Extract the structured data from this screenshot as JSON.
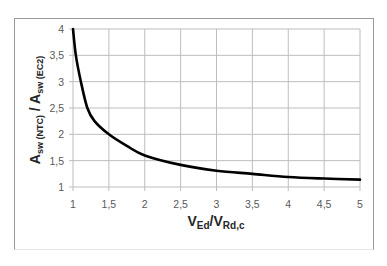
{
  "chart_data": {
    "type": "line",
    "title": "",
    "xlabel": "VEd/VRd,c",
    "ylabel": "Asw (NTC) / Asw (EC2)",
    "xlabel_parts": {
      "main1": "V",
      "sub1": "Ed",
      "sep": "/",
      "main2": "V",
      "sub2": "Rd,c"
    },
    "ylabel_parts": {
      "main1": "A",
      "sub1": "sw (NTC)",
      "sep": " / ",
      "main2": "A",
      "sub2": "sw (EC2)"
    },
    "xlim": [
      1,
      5
    ],
    "ylim": [
      1,
      4
    ],
    "x_ticks": [
      "1",
      "1,5",
      "2",
      "2,5",
      "3",
      "3,5",
      "4",
      "4,5",
      "5"
    ],
    "y_ticks": [
      "1",
      "1,5",
      "2",
      "2,5",
      "3",
      "3,5",
      "4"
    ],
    "grid": true,
    "legend": null,
    "series": [
      {
        "name": "Asw(NTC)/Asw(EC2)",
        "color": "#000000",
        "x": [
          1.0,
          1.04,
          1.11,
          1.2,
          1.3,
          1.5,
          1.75,
          2.0,
          2.5,
          3.0,
          3.5,
          4.0,
          4.5,
          5.0
        ],
        "y": [
          4.0,
          3.5,
          3.0,
          2.5,
          2.25,
          2.0,
          1.78,
          1.6,
          1.42,
          1.31,
          1.25,
          1.19,
          1.16,
          1.14
        ]
      }
    ]
  }
}
